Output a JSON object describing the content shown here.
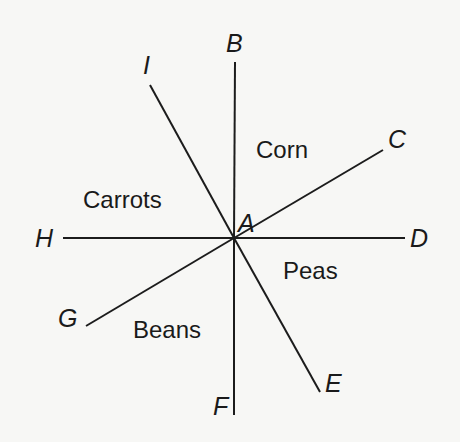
{
  "diagram": {
    "center": {
      "label": "A",
      "x": 234,
      "y": 238
    },
    "rays": [
      {
        "id": "B",
        "label": "B",
        "x2": 235,
        "y2": 62
      },
      {
        "id": "C",
        "label": "C",
        "x2": 383,
        "y2": 150
      },
      {
        "id": "D",
        "label": "D",
        "x2": 405,
        "y2": 238
      },
      {
        "id": "E",
        "label": "E",
        "x2": 320,
        "y2": 392
      },
      {
        "id": "F",
        "label": "F",
        "x2": 234,
        "y2": 415
      },
      {
        "id": "G",
        "label": "G",
        "x2": 86,
        "y2": 326
      },
      {
        "id": "H",
        "label": "H",
        "x2": 63,
        "y2": 238
      },
      {
        "id": "I",
        "label": "I",
        "x2": 150,
        "y2": 85
      }
    ],
    "point_labels": {
      "A": "A",
      "B": "B",
      "C": "C",
      "D": "D",
      "E": "E",
      "F": "F",
      "G": "G",
      "H": "H",
      "I": "I"
    },
    "regions": {
      "corn": "Corn",
      "carrots": "Carrots",
      "peas": "Peas",
      "beans": "Beans"
    },
    "colors": {
      "background": "#f7f7f5",
      "line": "#1c1c1c",
      "text": "#1a1a1a"
    }
  }
}
